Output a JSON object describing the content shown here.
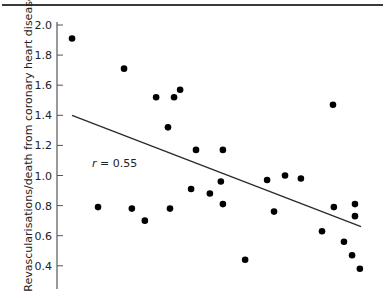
{
  "chart_data": {
    "type": "scatter",
    "title": "",
    "xlabel": "",
    "ylabel": "Revascularisations/death from coronary heart disease",
    "ylim": [
      0.3,
      2.0
    ],
    "yticks": [
      2.0,
      1.8,
      1.6,
      1.4,
      1.2,
      1.0,
      0.8,
      0.6,
      0.4
    ],
    "ytick_labels": [
      "2.0",
      "1.8",
      "1.6",
      "1.4",
      "1.2",
      "1.0",
      "0.8",
      "0.6",
      "0.4"
    ],
    "grid": false,
    "legend": null,
    "annotation": {
      "text": "r = 0.55",
      "var": "r",
      "value": "0.55"
    },
    "x_note": "x-axis not labelled in visible crop; x values are relative positions (0-100)",
    "points": [
      {
        "x": 5.2,
        "y": 1.91
      },
      {
        "x": 23.2,
        "y": 1.71
      },
      {
        "x": 34.3,
        "y": 1.52
      },
      {
        "x": 40.5,
        "y": 1.52
      },
      {
        "x": 42.6,
        "y": 1.57
      },
      {
        "x": 38.4,
        "y": 1.32
      },
      {
        "x": 48.1,
        "y": 1.17
      },
      {
        "x": 57.4,
        "y": 1.17
      },
      {
        "x": 14.2,
        "y": 0.79
      },
      {
        "x": 25.9,
        "y": 0.78
      },
      {
        "x": 30.4,
        "y": 0.7
      },
      {
        "x": 39.1,
        "y": 0.78
      },
      {
        "x": 46.4,
        "y": 0.91
      },
      {
        "x": 52.9,
        "y": 0.88
      },
      {
        "x": 56.7,
        "y": 0.96
      },
      {
        "x": 57.4,
        "y": 0.81
      },
      {
        "x": 65.1,
        "y": 0.44
      },
      {
        "x": 72.7,
        "y": 0.97
      },
      {
        "x": 75.1,
        "y": 0.76
      },
      {
        "x": 78.9,
        "y": 1.0
      },
      {
        "x": 84.4,
        "y": 0.98
      },
      {
        "x": 95.5,
        "y": 1.47
      },
      {
        "x": 95.8,
        "y": 0.79
      },
      {
        "x": 103.1,
        "y": 0.81
      },
      {
        "x": 103.1,
        "y": 0.73
      },
      {
        "x": 91.7,
        "y": 0.63
      },
      {
        "x": 99.3,
        "y": 0.56
      },
      {
        "x": 102.1,
        "y": 0.47
      },
      {
        "x": 104.8,
        "y": 0.38
      }
    ],
    "regression_line": {
      "x": [
        5.2,
        105.2
      ],
      "y": [
        1.4,
        0.66
      ]
    }
  },
  "labels": {
    "ylabel": "Revascularisations/death from coronary heart disease",
    "r_var": "r",
    "r_rest": " = 0.55"
  },
  "colors": {
    "points": "#000000",
    "line": "#2b2b2b",
    "axis": "#555555",
    "text": "#222222"
  }
}
